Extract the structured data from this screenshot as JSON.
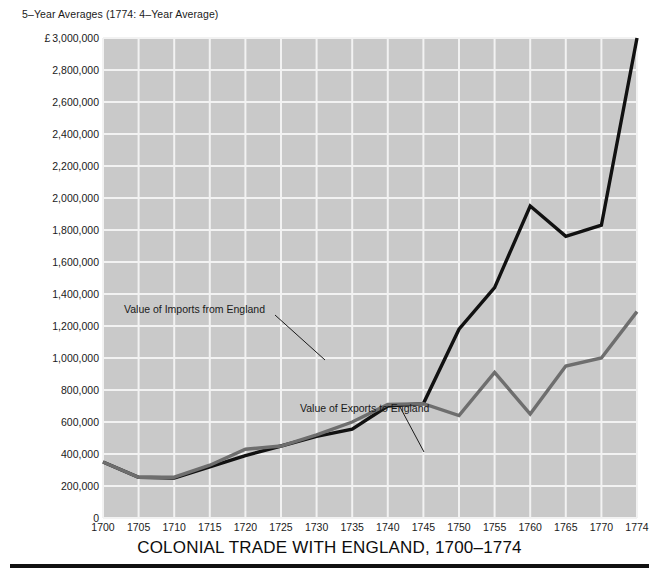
{
  "subtitle": "5–Year Averages (1774: 4–Year Average)",
  "title": "COLONIAL TRADE WITH ENGLAND, 1700–1774",
  "currency_symbol": "£",
  "annotations": {
    "imports": "Value of Imports from England",
    "exports": "Value of Exports to England"
  },
  "colors": {
    "plot_background": "#c9c9c9",
    "gridline": "#f2f2f2",
    "imports_line": "#111111",
    "exports_line": "#6e6e6e",
    "title_rule": "#111111",
    "text": "#1a1a1a"
  },
  "y_axis": {
    "ticks": [
      "3,000,000",
      "2,800,000",
      "2,600,000",
      "2,400,000",
      "2,200,000",
      "2,000,000",
      "1,800,000",
      "1,600,000",
      "1,400,000",
      "1,200,000",
      "1,000,000",
      "800,000",
      "600,000",
      "400,000",
      "200,000",
      "0"
    ]
  },
  "chart_data": {
    "type": "line",
    "title": "COLONIAL TRADE WITH ENGLAND, 1700–1774",
    "subtitle": "5–Year Averages (1774: 4–Year Average)",
    "xlabel": "",
    "ylabel": "£",
    "xlim": [
      1700,
      1774
    ],
    "ylim": [
      0,
      3000000
    ],
    "ytick_step": 200000,
    "grid": true,
    "legend": "annotated-inline",
    "x": [
      1700,
      1705,
      1710,
      1715,
      1720,
      1725,
      1730,
      1735,
      1740,
      1745,
      1750,
      1755,
      1760,
      1765,
      1770,
      1774
    ],
    "categories": [
      "1700",
      "1705",
      "1710",
      "1715",
      "1720",
      "1725",
      "1730",
      "1735",
      "1740",
      "1745",
      "1750",
      "1755",
      "1760",
      "1765",
      "1770",
      "1774"
    ],
    "series": [
      {
        "name": "Value of Imports from England",
        "color": "#111111",
        "values": [
          350000,
          255000,
          250000,
          320000,
          390000,
          450000,
          510000,
          555000,
          700000,
          715000,
          1180000,
          1440000,
          1950000,
          1760000,
          1830000,
          3000000
        ]
      },
      {
        "name": "Value of Exports to England",
        "color": "#6e6e6e",
        "values": [
          350000,
          255000,
          255000,
          330000,
          430000,
          450000,
          520000,
          600000,
          710000,
          715000,
          640000,
          910000,
          650000,
          950000,
          1000000,
          1290000
        ]
      }
    ]
  }
}
